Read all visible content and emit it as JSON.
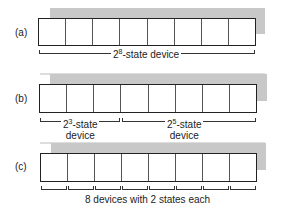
{
  "panels": [
    {
      "label": "(a)",
      "cells": 8,
      "caption_base": "2",
      "caption_exp": "8",
      "caption_rest": "-state device"
    },
    {
      "label": "(b)",
      "cells": 8,
      "groups": [
        {
          "base": "2",
          "exp": "3",
          "rest": "-state",
          "line2": "device",
          "span": 3
        },
        {
          "base": "2",
          "exp": "5",
          "rest": "-state",
          "line2": "device",
          "span": 5
        }
      ]
    },
    {
      "label": "(c)",
      "cells": 8,
      "caption": "8 devices with 2 states each"
    }
  ],
  "colors": {
    "shadow": "#c8c8c8",
    "outline": "#222222"
  }
}
